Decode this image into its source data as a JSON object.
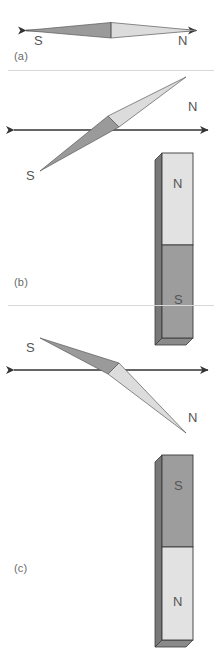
{
  "figure": {
    "background_color": "#ffffff",
    "divider_color": "#d8d8d8",
    "width": 222,
    "height": 668
  },
  "style": {
    "needle_dark_fill": "#9a9a9a",
    "needle_light_fill": "#dcdcdc",
    "needle_outline": "#5a5a5a",
    "axis_color": "#333333",
    "magnet_north_fill": "#e2e2e2",
    "magnet_south_fill": "#9d9d9d",
    "magnet_side_fill": "#787878",
    "magnet_outline": "#3a3a3a",
    "label_color": "#555555",
    "panel_label_color": "#6a6a6a"
  },
  "panels": [
    {
      "id": "a",
      "label": "(a)",
      "needle": {
        "angle_deg": 0,
        "south_label": "S",
        "north_label": "N",
        "south_side": "left",
        "north_side": "right"
      },
      "axis": {
        "label": "field-line-axis",
        "double_headed": true,
        "orientation": "horizontal"
      },
      "magnet": null
    },
    {
      "id": "b",
      "label": "(b)",
      "needle": {
        "angle_deg": -20,
        "south_label": "S",
        "north_label": "N",
        "south_side": "lower-left",
        "north_side": "upper-right"
      },
      "axis": {
        "label": "field-line-axis",
        "double_headed": true,
        "orientation": "horizontal"
      },
      "magnet": {
        "top_pole": "N",
        "bottom_pole": "S",
        "orientation": "vertical"
      }
    },
    {
      "id": "c",
      "label": "(c)",
      "needle": {
        "angle_deg": 20,
        "south_label": "S",
        "north_label": "N",
        "south_side": "upper-left",
        "north_side": "lower-right"
      },
      "axis": {
        "label": "field-line-axis",
        "double_headed": true,
        "orientation": "horizontal"
      },
      "magnet": {
        "top_pole": "S",
        "bottom_pole": "N",
        "orientation": "vertical"
      }
    }
  ]
}
